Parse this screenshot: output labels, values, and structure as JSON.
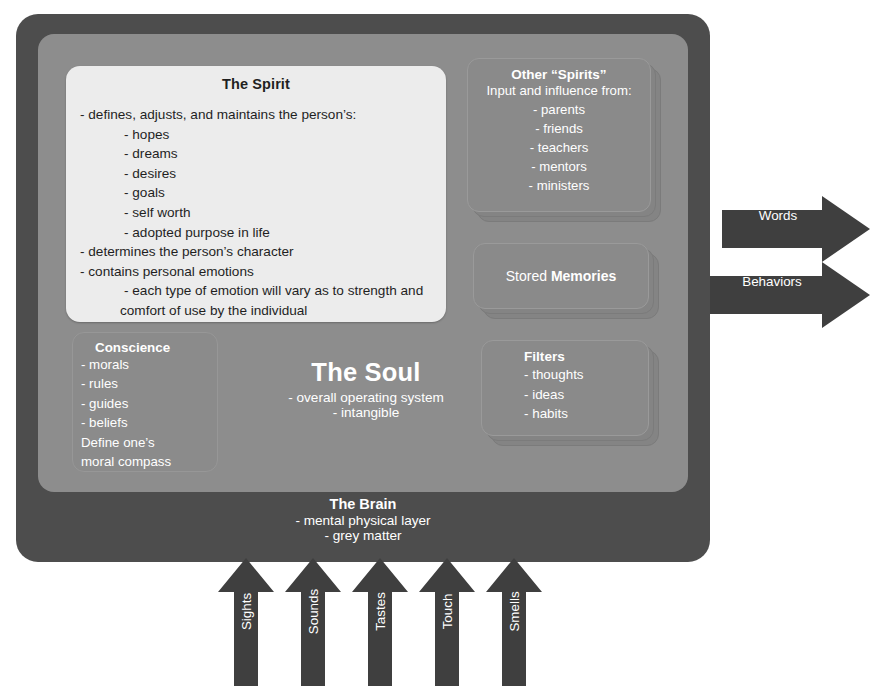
{
  "diagram": {
    "colors": {
      "outer_frame": "#4d4d4d",
      "inner_panel": "#8d8d8d",
      "spirit_card": "#ececec",
      "card_face": "#8a8a8a",
      "arrow": "#3f3f3f",
      "text_light": "#ffffff",
      "text_dark": "#1f1f1f"
    }
  },
  "spirit": {
    "title": "The Spirit",
    "lines": [
      {
        "indent": 1,
        "text": "- defines, adjusts, and maintains the person’s:"
      },
      {
        "indent": 2,
        "text": "- hopes"
      },
      {
        "indent": 2,
        "text": "- dreams"
      },
      {
        "indent": 2,
        "text": "- desires"
      },
      {
        "indent": 2,
        "text": "- goals"
      },
      {
        "indent": 2,
        "text": "- self worth"
      },
      {
        "indent": 2,
        "text": "- adopted purpose in life"
      },
      {
        "indent": 1,
        "text": "- determines the person’s character"
      },
      {
        "indent": 1,
        "text": "- contains personal emotions"
      },
      {
        "indent": 2,
        "text": "- each type of emotion will vary as to strength and"
      },
      {
        "indent": 3,
        "text": "comfort of use by the individual"
      }
    ]
  },
  "other_spirits": {
    "title": "Other “Spirits”",
    "subtitle": "Input and influence from:",
    "items": [
      "- parents",
      "- friends",
      "- teachers",
      "- mentors",
      "- ministers"
    ]
  },
  "stored_memories": {
    "prefix": "Stored ",
    "emphasis": "Memories"
  },
  "filters": {
    "title": "Filters",
    "items": [
      "- thoughts",
      "- ideas",
      "- habits"
    ]
  },
  "conscience": {
    "title": "Conscience",
    "items": [
      "- morals",
      "- rules",
      "- guides",
      "- beliefs"
    ],
    "footer": [
      "Define one’s",
      "moral compass"
    ]
  },
  "soul": {
    "title": "The Soul",
    "sub1": "- overall operating system",
    "sub2": "- intangible"
  },
  "brain": {
    "title": "The Brain",
    "sub1": "- mental physical layer",
    "sub2": "- grey matter"
  },
  "outputs": [
    {
      "label": "Words",
      "direction": "right"
    },
    {
      "label": "Behaviors",
      "direction": "right"
    }
  ],
  "senses": [
    {
      "label": "Sights",
      "direction": "up"
    },
    {
      "label": "Sounds",
      "direction": "up"
    },
    {
      "label": "Tastes",
      "direction": "up"
    },
    {
      "label": "Touch",
      "direction": "up"
    },
    {
      "label": "Smells",
      "direction": "up"
    }
  ]
}
